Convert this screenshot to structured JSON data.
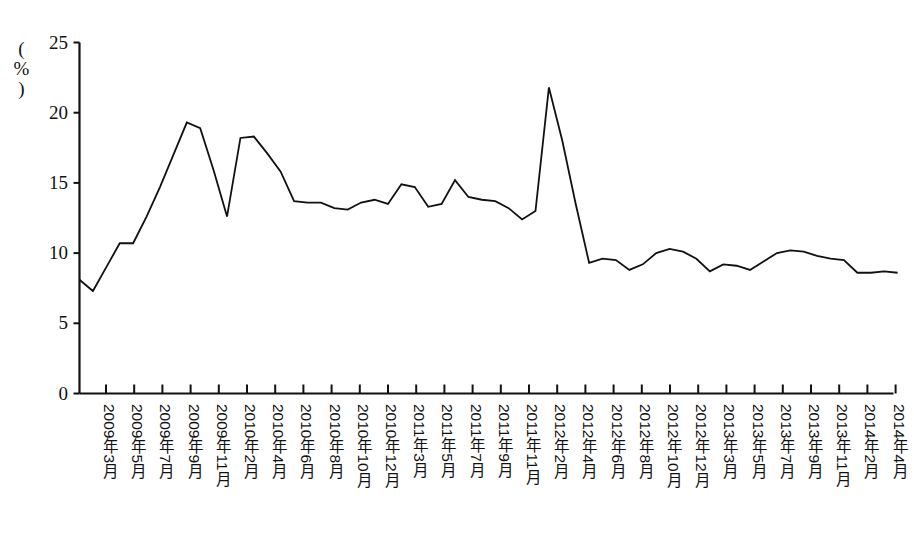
{
  "chart_data": {
    "type": "line",
    "title": "",
    "subtitle": "",
    "xlabel": "",
    "ylabel": "(%)",
    "ylim": [
      0,
      25
    ],
    "yticks": [
      0,
      5,
      10,
      15,
      20,
      25
    ],
    "grid": false,
    "legend": null,
    "axis_unit_label": "(%)",
    "tick_labels": [
      "2009年3月",
      "2009年5月",
      "2009年7月",
      "2009年9月",
      "2009年11月",
      "2010年2月",
      "2010年4月",
      "2010年6月",
      "2010年8月",
      "2010年10月",
      "2010年12月",
      "2011年3月",
      "2011年5月",
      "2011年7月",
      "2011年9月",
      "2011年11月",
      "2012年2月",
      "2012年4月",
      "2012年6月",
      "2012年8月",
      "2012年10月",
      "2012年12月",
      "2013年3月",
      "2013年5月",
      "2013年7月",
      "2013年9月",
      "2013年11月",
      "2014年2月",
      "2014年4月"
    ],
    "x": [
      "2009-03",
      "2009-04",
      "2009-05",
      "2009-06",
      "2009-07",
      "2009-08",
      "2009-09",
      "2009-10",
      "2009-11",
      "2009-12",
      "2010-01",
      "2010-02",
      "2010-03",
      "2010-04",
      "2010-05",
      "2010-06",
      "2010-07",
      "2010-08",
      "2010-09",
      "2010-10",
      "2010-11",
      "2010-12",
      "2011-01",
      "2011-02",
      "2011-03",
      "2011-04",
      "2011-05",
      "2011-06",
      "2011-07",
      "2011-08",
      "2011-09",
      "2011-10",
      "2011-11",
      "2011-12",
      "2012-01",
      "2012-02",
      "2012-03",
      "2012-04",
      "2012-05",
      "2012-06",
      "2012-07",
      "2012-08",
      "2012-09",
      "2012-10",
      "2012-11",
      "2012-12",
      "2013-01",
      "2013-02",
      "2013-03",
      "2013-04",
      "2013-05",
      "2013-06",
      "2013-07",
      "2013-08",
      "2013-09",
      "2013-10",
      "2013-11",
      "2013-12",
      "2014-01",
      "2014-02",
      "2014-03",
      "2014-04"
    ],
    "values": [
      8.1,
      7.3,
      9.0,
      10.7,
      10.7,
      12.6,
      14.7,
      17.0,
      19.3,
      18.9,
      15.9,
      12.6,
      18.2,
      18.3,
      17.1,
      15.8,
      13.7,
      13.6,
      13.6,
      13.2,
      13.1,
      13.6,
      13.8,
      13.5,
      14.9,
      14.7,
      13.3,
      13.5,
      15.2,
      14.0,
      13.8,
      13.7,
      13.2,
      12.4,
      13.0,
      21.8,
      18.0,
      13.5,
      9.3,
      9.6,
      9.5,
      8.8,
      9.2,
      10.0,
      10.3,
      10.1,
      9.6,
      8.7,
      9.2,
      9.1,
      8.8,
      9.4,
      10.0,
      10.2,
      10.1,
      9.8,
      9.6,
      9.5,
      8.6,
      8.6,
      8.7,
      8.6
    ],
    "series_name": "增速",
    "line_color": "#111111",
    "line_width": 1.8
  }
}
